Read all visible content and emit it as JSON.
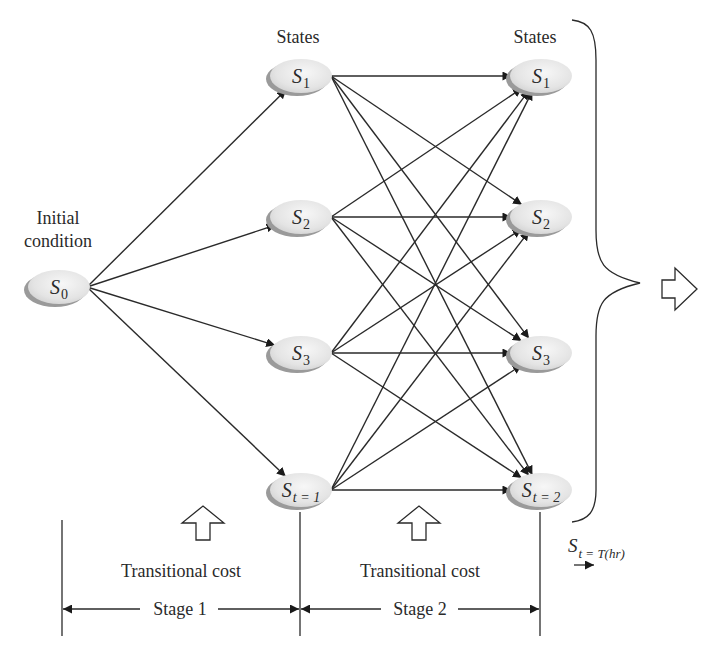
{
  "labels": {
    "initial_line1": "Initial",
    "initial_line2": "condition",
    "states_stage1": "States",
    "states_stage2": "States",
    "transitional_cost_1": "Transitional cost",
    "transitional_cost_2": "Transitional cost",
    "stage_1": "Stage 1",
    "stage_2": "Stage 2",
    "final_main": "S",
    "final_sub": "t = T(hr)"
  },
  "nodes": {
    "initial": {
      "main": "S",
      "sub": "0"
    },
    "stage1": [
      {
        "main": "S",
        "sub": "1"
      },
      {
        "main": "S",
        "sub": "2"
      },
      {
        "main": "S",
        "sub": "3"
      },
      {
        "main": "S",
        "sub": "t = 1"
      }
    ],
    "stage2": [
      {
        "main": "S",
        "sub": "1"
      },
      {
        "main": "S",
        "sub": "2"
      },
      {
        "main": "S",
        "sub": "3"
      },
      {
        "main": "S",
        "sub": "t = 2"
      }
    ]
  },
  "edges": {
    "initial_to_stage1": "all",
    "stage1_to_stage2": "all-to-all"
  },
  "colors": {
    "line": "#2a2a2a",
    "node_fill": "#e6e6e6",
    "node_shadow": "#9a9a9a"
  }
}
